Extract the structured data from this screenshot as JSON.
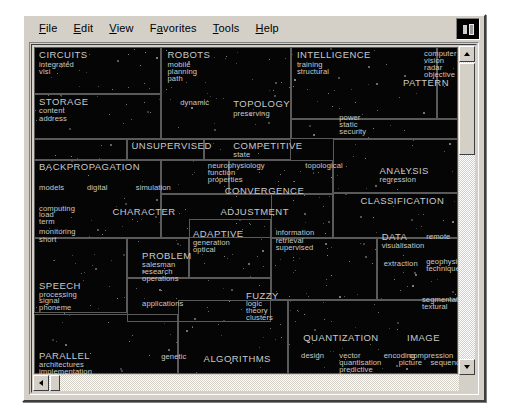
{
  "window": {
    "menu": [
      {
        "label": "File",
        "accel": "F"
      },
      {
        "label": "Edit",
        "accel": "E"
      },
      {
        "label": "View",
        "accel": "V"
      },
      {
        "label": "Favorites",
        "accel": "a"
      },
      {
        "label": "Tools",
        "accel": "T"
      },
      {
        "label": "Help",
        "accel": "H"
      }
    ],
    "logo_icon": "application-logo-icon"
  },
  "scrollbars": {
    "vertical": {
      "up": "scroll-up-arrow",
      "down": "scroll-down-arrow"
    },
    "horizontal": {
      "left": "scroll-left-arrow",
      "right": "scroll-right-arrow"
    }
  },
  "map": {
    "background": "#050505",
    "cell_border": "#5a5a5a",
    "label_color": "#c9c9c9",
    "cells": [
      {
        "x": 0,
        "y": 0,
        "w": 30.0,
        "h": 14.5
      },
      {
        "x": 0,
        "y": 14.5,
        "w": 30.0,
        "h": 13.5
      },
      {
        "x": 30.0,
        "y": 0,
        "w": 30.5,
        "h": 28.0
      },
      {
        "x": 60.5,
        "y": 0,
        "w": 34.5,
        "h": 22.0
      },
      {
        "x": 95.0,
        "y": 0,
        "w": 5.0,
        "h": 22.0
      },
      {
        "x": 60.5,
        "y": 22.0,
        "w": 39.5,
        "h": 6.0
      },
      {
        "x": 22.0,
        "y": 28.0,
        "w": 18.0,
        "h": 6.5
      },
      {
        "x": 40.0,
        "y": 28.0,
        "w": 20.5,
        "h": 6.5
      },
      {
        "x": 0,
        "y": 28.0,
        "w": 22.0,
        "h": 6.5
      },
      {
        "x": 0,
        "y": 34.5,
        "w": 30.0,
        "h": 24.0
      },
      {
        "x": 30.0,
        "y": 34.5,
        "w": 16.0,
        "h": 10.5
      },
      {
        "x": 46.0,
        "y": 34.5,
        "w": 24.5,
        "h": 10.5
      },
      {
        "x": 70.5,
        "y": 28.0,
        "w": 29.5,
        "h": 16.5
      },
      {
        "x": 30.0,
        "y": 45.0,
        "w": 40.5,
        "h": 13.5
      },
      {
        "x": 70.5,
        "y": 44.5,
        "w": 29.5,
        "h": 14.0
      },
      {
        "x": 0,
        "y": 58.5,
        "w": 22.0,
        "h": 23.0
      },
      {
        "x": 22.0,
        "y": 58.5,
        "w": 14.5,
        "h": 12.0
      },
      {
        "x": 36.5,
        "y": 52.5,
        "w": 19.5,
        "h": 18.0
      },
      {
        "x": 56.0,
        "y": 58.5,
        "w": 25.0,
        "h": 19.0
      },
      {
        "x": 81.0,
        "y": 58.5,
        "w": 19.0,
        "h": 19.0
      },
      {
        "x": 22.0,
        "y": 70.5,
        "w": 34.0,
        "h": 13.5
      },
      {
        "x": 0,
        "y": 81.5,
        "w": 34.0,
        "h": 18.5
      },
      {
        "x": 34.0,
        "y": 77.5,
        "w": 26.0,
        "h": 22.5
      },
      {
        "x": 60.0,
        "y": 77.5,
        "w": 40.0,
        "h": 22.5
      },
      {
        "x": 56.0,
        "y": 44.5,
        "w": 14.5,
        "h": 14.0
      }
    ],
    "labels": [
      {
        "text": "CIRCUITS",
        "x": 1.2,
        "y": 1.0,
        "k": "major"
      },
      {
        "text": "integrated",
        "x": 1.2,
        "y": 4.2,
        "k": "minor"
      },
      {
        "text": "vlsi",
        "x": 1.2,
        "y": 6.5,
        "k": "minor"
      },
      {
        "text": "STORAGE",
        "x": 1.2,
        "y": 15.2,
        "k": "major"
      },
      {
        "text": "content",
        "x": 1.2,
        "y": 18.4,
        "k": "minor"
      },
      {
        "text": "address",
        "x": 1.2,
        "y": 20.7,
        "k": "minor"
      },
      {
        "text": "ROBOTS",
        "x": 31.5,
        "y": 1.0,
        "k": "major"
      },
      {
        "text": "mobile",
        "x": 31.5,
        "y": 4.2,
        "k": "minor"
      },
      {
        "text": "planning",
        "x": 31.5,
        "y": 6.4,
        "k": "minor"
      },
      {
        "text": "path",
        "x": 31.5,
        "y": 8.6,
        "k": "minor"
      },
      {
        "text": "dynamic",
        "x": 34.5,
        "y": 16.0,
        "k": "minor"
      },
      {
        "text": "INTELLIGENCE",
        "x": 62.0,
        "y": 1.0,
        "k": "major"
      },
      {
        "text": "training",
        "x": 62.0,
        "y": 4.2,
        "k": "minor"
      },
      {
        "text": "structural",
        "x": 62.0,
        "y": 6.4,
        "k": "minor"
      },
      {
        "text": "computer",
        "x": 92.0,
        "y": 0.8,
        "k": "minor"
      },
      {
        "text": "vision",
        "x": 92.0,
        "y": 3.0,
        "k": "minor"
      },
      {
        "text": "radar",
        "x": 92.0,
        "y": 5.2,
        "k": "minor"
      },
      {
        "text": "objective",
        "x": 92.0,
        "y": 7.4,
        "k": "minor"
      },
      {
        "text": "PATTERN",
        "x": 87.0,
        "y": 9.6,
        "k": "major"
      },
      {
        "text": "TOPOLOGY",
        "x": 47.0,
        "y": 16.0,
        "k": "major"
      },
      {
        "text": "preserving",
        "x": 47.0,
        "y": 19.2,
        "k": "minor"
      },
      {
        "text": "power",
        "x": 72.0,
        "y": 20.5,
        "k": "minor"
      },
      {
        "text": "static",
        "x": 72.0,
        "y": 22.7,
        "k": "minor"
      },
      {
        "text": "security",
        "x": 72.0,
        "y": 24.9,
        "k": "minor"
      },
      {
        "text": "UNSUPERVISED",
        "x": 23.0,
        "y": 28.6,
        "k": "major"
      },
      {
        "text": "COMPETITIVE",
        "x": 47.0,
        "y": 28.6,
        "k": "major"
      },
      {
        "text": "state",
        "x": 47.0,
        "y": 31.8,
        "k": "minor"
      },
      {
        "text": "BACKPROPAGATION",
        "x": 1.2,
        "y": 35.1,
        "k": "major"
      },
      {
        "text": "neurophysiology",
        "x": 41.0,
        "y": 35.1,
        "k": "minor"
      },
      {
        "text": "function",
        "x": 41.0,
        "y": 37.3,
        "k": "minor"
      },
      {
        "text": "properties",
        "x": 41.0,
        "y": 39.5,
        "k": "minor"
      },
      {
        "text": "topological",
        "x": 64.0,
        "y": 35.1,
        "k": "minor"
      },
      {
        "text": "ANALYSIS",
        "x": 81.5,
        "y": 36.3,
        "k": "major"
      },
      {
        "text": "regression",
        "x": 81.5,
        "y": 39.5,
        "k": "minor"
      },
      {
        "text": "models",
        "x": 1.2,
        "y": 41.8,
        "k": "minor"
      },
      {
        "text": "digital",
        "x": 12.5,
        "y": 41.8,
        "k": "minor"
      },
      {
        "text": "simulation",
        "x": 24.0,
        "y": 41.8,
        "k": "minor"
      },
      {
        "text": "CONVERGENCE",
        "x": 45.0,
        "y": 42.5,
        "k": "major"
      },
      {
        "text": "CLASSIFICATION",
        "x": 77.0,
        "y": 45.5,
        "k": "major"
      },
      {
        "text": "computing",
        "x": 1.2,
        "y": 48.2,
        "k": "minor"
      },
      {
        "text": "load",
        "x": 1.2,
        "y": 50.3,
        "k": "minor"
      },
      {
        "text": "term",
        "x": 1.2,
        "y": 52.4,
        "k": "minor"
      },
      {
        "text": "CHARACTER",
        "x": 18.5,
        "y": 49.0,
        "k": "major"
      },
      {
        "text": "ADJUSTMENT",
        "x": 44.0,
        "y": 49.0,
        "k": "major"
      },
      {
        "text": "monitoring",
        "x": 1.2,
        "y": 55.5,
        "k": "minor"
      },
      {
        "text": "short",
        "x": 1.2,
        "y": 57.7,
        "k": "minor"
      },
      {
        "text": "ADAPTIVE",
        "x": 37.5,
        "y": 55.8,
        "k": "major"
      },
      {
        "text": "generation",
        "x": 37.5,
        "y": 58.8,
        "k": "minor"
      },
      {
        "text": "optical",
        "x": 37.5,
        "y": 60.9,
        "k": "minor"
      },
      {
        "text": "information",
        "x": 57.0,
        "y": 55.8,
        "k": "minor"
      },
      {
        "text": "retrieval",
        "x": 57.0,
        "y": 58.0,
        "k": "minor"
      },
      {
        "text": "supervised",
        "x": 57.0,
        "y": 60.2,
        "k": "minor"
      },
      {
        "text": "DATA",
        "x": 82.0,
        "y": 56.5,
        "k": "major"
      },
      {
        "text": "visualisation",
        "x": 82.0,
        "y": 59.5,
        "k": "minor"
      },
      {
        "text": "remote",
        "x": 92.5,
        "y": 57.0,
        "k": "minor"
      },
      {
        "text": "PROBLEM",
        "x": 25.5,
        "y": 62.5,
        "k": "major"
      },
      {
        "text": "salesman",
        "x": 25.5,
        "y": 65.5,
        "k": "minor"
      },
      {
        "text": "research",
        "x": 25.5,
        "y": 67.6,
        "k": "minor"
      },
      {
        "text": "operations",
        "x": 25.5,
        "y": 69.7,
        "k": "minor"
      },
      {
        "text": "extraction",
        "x": 82.5,
        "y": 65.0,
        "k": "minor"
      },
      {
        "text": "geophysical",
        "x": 92.5,
        "y": 64.5,
        "k": "minor"
      },
      {
        "text": "technique",
        "x": 92.5,
        "y": 66.7,
        "k": "minor"
      },
      {
        "text": "SPEECH",
        "x": 1.2,
        "y": 71.5,
        "k": "major"
      },
      {
        "text": "processing",
        "x": 1.2,
        "y": 74.5,
        "k": "minor"
      },
      {
        "text": "signal",
        "x": 1.2,
        "y": 76.6,
        "k": "minor"
      },
      {
        "text": "phoneme",
        "x": 1.2,
        "y": 78.7,
        "k": "minor"
      },
      {
        "text": "applications",
        "x": 25.5,
        "y": 77.5,
        "k": "minor"
      },
      {
        "text": "FUZZY",
        "x": 50.0,
        "y": 74.5,
        "k": "major"
      },
      {
        "text": "logic",
        "x": 50.0,
        "y": 77.3,
        "k": "minor"
      },
      {
        "text": "theory",
        "x": 50.0,
        "y": 79.4,
        "k": "minor"
      },
      {
        "text": "clusters",
        "x": 50.0,
        "y": 81.5,
        "k": "minor"
      },
      {
        "text": "segmentation",
        "x": 91.5,
        "y": 76.0,
        "k": "minor"
      },
      {
        "text": "textural",
        "x": 91.5,
        "y": 78.2,
        "k": "minor"
      },
      {
        "text": "QUANTIZATION",
        "x": 63.5,
        "y": 87.5,
        "k": "major"
      },
      {
        "text": "IMAGE",
        "x": 88.0,
        "y": 87.5,
        "k": "major"
      },
      {
        "text": "PARALLEL",
        "x": 1.2,
        "y": 93.0,
        "k": "major"
      },
      {
        "text": "architectures",
        "x": 1.2,
        "y": 96.0,
        "k": "minor"
      },
      {
        "text": "implementation",
        "x": 1.2,
        "y": 98.1,
        "k": "minor"
      },
      {
        "text": "genetic",
        "x": 30.0,
        "y": 93.5,
        "k": "minor"
      },
      {
        "text": "ALGORITHMS",
        "x": 40.0,
        "y": 94.0,
        "k": "major"
      },
      {
        "text": "design",
        "x": 63.0,
        "y": 93.3,
        "k": "minor"
      },
      {
        "text": "vector",
        "x": 72.0,
        "y": 93.3,
        "k": "minor"
      },
      {
        "text": "quantisation",
        "x": 72.0,
        "y": 95.5,
        "k": "minor"
      },
      {
        "text": "predictive",
        "x": 72.0,
        "y": 97.6,
        "k": "minor"
      },
      {
        "text": "encoding",
        "x": 82.5,
        "y": 93.3,
        "k": "minor"
      },
      {
        "text": "compression",
        "x": 88.5,
        "y": 93.3,
        "k": "minor"
      },
      {
        "text": "picture",
        "x": 86.0,
        "y": 95.5,
        "k": "minor"
      },
      {
        "text": "sequence",
        "x": 93.5,
        "y": 95.5,
        "k": "minor"
      }
    ]
  }
}
